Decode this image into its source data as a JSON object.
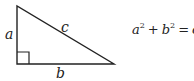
{
  "diagram": {
    "type": "right-triangle",
    "sides": {
      "vertical": "a",
      "horizontal": "b",
      "hypotenuse": "c"
    },
    "right_angle_marker": true,
    "formula": {
      "var1": "a",
      "exp1": "2",
      "plus": "+",
      "var2": "b",
      "exp2": "2",
      "equals": "=",
      "var3": "c",
      "exp3": "2"
    },
    "colors": {
      "stroke": "#222222",
      "background": "#ffffff"
    }
  }
}
